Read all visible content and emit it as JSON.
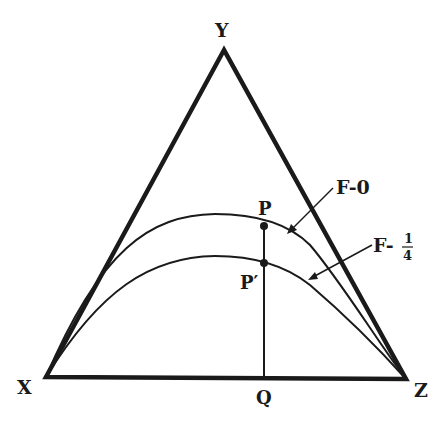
{
  "diagram": {
    "type": "ternary-triangle",
    "vertices": {
      "top": "Y",
      "left": "X",
      "right": "Z"
    },
    "points": {
      "upper": "P",
      "lower": "P′",
      "base": "Q"
    },
    "curves": [
      {
        "label_prefix": "F-",
        "label_value": "0"
      },
      {
        "label_prefix": "F-",
        "label_num": "1",
        "label_den": "4"
      }
    ],
    "colors": {
      "ink": "#1a1a1a",
      "background": "#ffffff"
    }
  }
}
